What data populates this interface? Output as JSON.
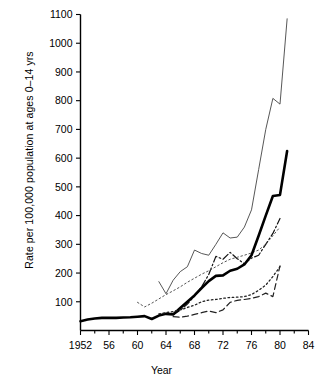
{
  "chart_data": {
    "type": "line",
    "title": "",
    "xlabel": "Year",
    "ylabel": "Rate per 100,000 population at ages 0–14 yrs",
    "xlim": [
      1952,
      1984
    ],
    "ylim": [
      0,
      1100
    ],
    "xticks": [
      1952,
      1956,
      1960,
      1964,
      1968,
      1972,
      1976,
      1980,
      1984
    ],
    "xtick_labels": [
      "1952",
      "56",
      "60",
      "64",
      "68",
      "72",
      "76",
      "80",
      "84"
    ],
    "xminor_step": 2,
    "yticks": [
      100,
      200,
      300,
      400,
      500,
      600,
      700,
      800,
      900,
      1000,
      1100
    ],
    "ytick_labels": [
      "100",
      "200",
      "300",
      "400",
      "500",
      "600",
      "700",
      "800",
      "900",
      "1000",
      "1100"
    ],
    "grid": false,
    "legend": "none",
    "series": [
      {
        "name": "thin-solid",
        "style": "solid",
        "width": 0.9,
        "color": "#444444",
        "x": [
          1963,
          1964,
          1965,
          1966,
          1967,
          1968,
          1969,
          1970,
          1971,
          1972,
          1973,
          1974,
          1975,
          1976,
          1977,
          1978,
          1979,
          1980,
          1981
        ],
        "y": [
          170,
          128,
          175,
          205,
          222,
          280,
          268,
          262,
          300,
          340,
          322,
          325,
          360,
          420,
          560,
          700,
          808,
          788,
          1085
        ]
      },
      {
        "name": "dash-dot",
        "style": "dashdot",
        "width": 1.2,
        "color": "#111111",
        "x": [
          1965,
          1966,
          1967,
          1968,
          1969,
          1970,
          1971,
          1972,
          1973,
          1974,
          1975,
          1976,
          1977,
          1978,
          1979,
          1980
        ],
        "y": [
          55,
          70,
          92,
          120,
          152,
          195,
          258,
          248,
          272,
          250,
          232,
          252,
          262,
          300,
          338,
          390
        ]
      },
      {
        "name": "dotted-fine",
        "style": "dotted",
        "width": 1.0,
        "color": "#555555",
        "x": [
          1960,
          1961,
          1962,
          1963,
          1964,
          1965,
          1966,
          1967,
          1968,
          1969,
          1970,
          1971,
          1972,
          1973,
          1974,
          1975,
          1976,
          1977,
          1978,
          1979,
          1980
        ],
        "y": [
          98,
          82,
          95,
          110,
          125,
          138,
          152,
          168,
          182,
          196,
          208,
          222,
          236,
          248,
          255,
          262,
          270,
          280,
          300,
          330,
          360
        ]
      },
      {
        "name": "thick-solid",
        "style": "solid",
        "width": 2.6,
        "color": "#000000",
        "x": [
          1952,
          1953,
          1954,
          1955,
          1956,
          1957,
          1958,
          1959,
          1960,
          1961,
          1962,
          1963,
          1964,
          1965,
          1966,
          1967,
          1968,
          1969,
          1970,
          1971,
          1972,
          1973,
          1974,
          1975,
          1976,
          1977,
          1978,
          1979,
          1980,
          1981
        ],
        "y": [
          32,
          38,
          42,
          44,
          44,
          44,
          45,
          46,
          48,
          50,
          40,
          52,
          58,
          56,
          78,
          100,
          122,
          148,
          172,
          190,
          192,
          208,
          215,
          230,
          262,
          330,
          400,
          468,
          472,
          625
        ]
      },
      {
        "name": "dashed",
        "style": "dashed",
        "width": 1.2,
        "color": "#222222",
        "x": [
          1965,
          1966,
          1967,
          1968,
          1969,
          1970,
          1971,
          1972,
          1973,
          1974,
          1975,
          1976,
          1977,
          1978,
          1979,
          1980
        ],
        "y": [
          48,
          46,
          50,
          56,
          62,
          68,
          62,
          72,
          98,
          105,
          108,
          112,
          118,
          130,
          118,
          225
        ]
      },
      {
        "name": "dotted-coarse",
        "style": "dotted",
        "width": 1.3,
        "color": "#222222",
        "x": [
          1963,
          1964,
          1965,
          1966,
          1967,
          1968,
          1969,
          1970,
          1971,
          1972,
          1973,
          1974,
          1975,
          1976,
          1977,
          1978,
          1979,
          1980
        ],
        "y": [
          58,
          62,
          66,
          72,
          80,
          88,
          100,
          106,
          108,
          112,
          115,
          116,
          118,
          125,
          140,
          158,
          188,
          222
        ]
      }
    ]
  },
  "axes": {
    "x_axis_title": "Year",
    "y_axis_title": "Rate per 100,000 population at ages 0–14 yrs"
  }
}
